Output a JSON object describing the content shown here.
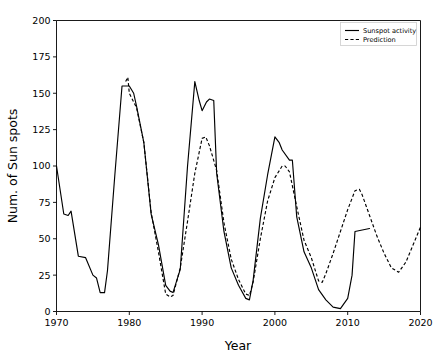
{
  "chart_data": {
    "type": "line",
    "title": "",
    "xlabel": "Year",
    "ylabel": "Num. of Sun spots",
    "xlim": [
      1970,
      2020
    ],
    "ylim": [
      0,
      200
    ],
    "xticks": [
      1970,
      1980,
      1990,
      2000,
      2010,
      2020
    ],
    "xticklabels": [
      "1970",
      "1980",
      "1990",
      "2000",
      "2010",
      "2020"
    ],
    "yticks": [
      0,
      25,
      50,
      75,
      100,
      125,
      150,
      175,
      200
    ],
    "yticklabels": [
      "0",
      "25",
      "50",
      "75",
      "100",
      "125",
      "150",
      "175",
      "200"
    ],
    "grid": false,
    "legend_position": "upper right",
    "legend_entries": [
      "Sunspot activity",
      "Prediction"
    ],
    "series": [
      {
        "name": "Sunspot activity",
        "style": "solid",
        "color": "#000000",
        "x": [
          1970,
          1971,
          1971.6,
          1972,
          1973,
          1974,
          1975,
          1975.5,
          1976,
          1976.6,
          1977,
          1978,
          1979,
          1979.6,
          1980,
          1980.6,
          1981,
          1982,
          1983,
          1984,
          1985,
          1985.6,
          1986,
          1987,
          1988,
          1989,
          1989.6,
          1990,
          1990.6,
          1991,
          1991.6,
          1992,
          1993,
          1994,
          1995,
          1996,
          1996.5,
          1997,
          1998,
          1999,
          2000,
          2000.6,
          2001,
          2002,
          2002.4,
          2003,
          2004,
          2005,
          2006,
          2007,
          2008,
          2009,
          2010,
          2010.6,
          2011,
          2012,
          2013
        ],
        "y": [
          100,
          67,
          66,
          69,
          38,
          37,
          25,
          23,
          13,
          13,
          28,
          93,
          155,
          155,
          155,
          150,
          141,
          116,
          67,
          46,
          18,
          14,
          13,
          29,
          100,
          158,
          145,
          138,
          144,
          146,
          145,
          95,
          55,
          30,
          18,
          9,
          8,
          21,
          64,
          94,
          120,
          116,
          111,
          104,
          104,
          65,
          41,
          30,
          15,
          8,
          3,
          2,
          9,
          25,
          55,
          56,
          57
        ]
      },
      {
        "name": "Prediction",
        "style": "dashed",
        "color": "#000000",
        "x": [
          1979.5,
          1979.8,
          1980,
          1981,
          1982,
          1983,
          1984,
          1985,
          1985.6,
          1986,
          1987,
          1988,
          1989,
          1990,
          1990.5,
          1991,
          1992,
          1993,
          1994,
          1995,
          1996,
          1996.5,
          1997,
          1998,
          1999,
          2000,
          2001,
          2001.4,
          2002,
          2003,
          2004,
          2005,
          2006,
          2006.5,
          2007,
          2008,
          2009,
          2010,
          2011,
          2011.6,
          2012,
          2013,
          2014,
          2015,
          2016,
          2017,
          2018,
          2019,
          2020
        ],
        "y": [
          158,
          161,
          150,
          140,
          116,
          68,
          41,
          12,
          10,
          11,
          30,
          62,
          95,
          119,
          120,
          114,
          97,
          61,
          36,
          22,
          12,
          11,
          20,
          50,
          76,
          92,
          100,
          100,
          96,
          72,
          49,
          37,
          21,
          20,
          26,
          40,
          55,
          70,
          83,
          84,
          80,
          66,
          52,
          40,
          30,
          27,
          34,
          46,
          58
        ]
      }
    ]
  },
  "axes": {
    "xlabel": "Year",
    "ylabel": "Num. of Sun spots"
  },
  "legend": {
    "items": [
      {
        "label": "Sunspot activity",
        "style": "solid"
      },
      {
        "label": "Prediction",
        "style": "dashed"
      }
    ]
  }
}
